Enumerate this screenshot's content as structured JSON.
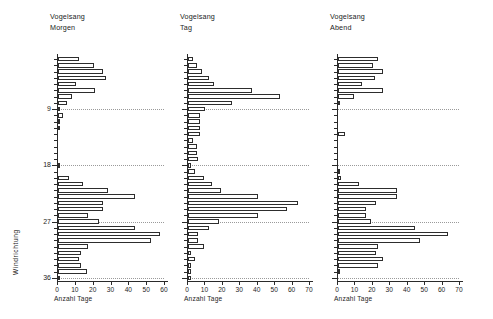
{
  "figure": {
    "axis_x_caption": "Anzahl Tage",
    "axis_y_caption": "Windrichtung",
    "y_tick_labels": [
      "9",
      "18",
      "27",
      "36"
    ],
    "y_tick_values": [
      9,
      18,
      27,
      36
    ],
    "gridline_values": [
      9,
      18,
      27,
      36
    ],
    "line_color": "#2d2d2d",
    "bar_fill": "#ffffff",
    "grid_color": "#9a9a9a"
  },
  "chart_data": [
    {
      "type": "bar",
      "orientation": "horizontal",
      "title": "Vogelsang",
      "subtitle": "Morgen",
      "xlabel": "Anzahl Tage",
      "ylabel": "Windrichtung",
      "xlim": [
        0,
        60
      ],
      "ylim": [
        0,
        37
      ],
      "xticks": [
        0,
        10,
        20,
        30,
        40,
        50,
        60
      ],
      "xtick_labels": [
        "0",
        "10",
        "20",
        "30",
        "40",
        "50",
        "60"
      ],
      "yticks": [
        9,
        18,
        27,
        36
      ],
      "grid": true,
      "categories": [
        1,
        2,
        3,
        4,
        5,
        6,
        7,
        8,
        9,
        10,
        11,
        12,
        13,
        14,
        15,
        16,
        17,
        18,
        19,
        20,
        21,
        22,
        23,
        24,
        25,
        26,
        27,
        28,
        29,
        30,
        31,
        32,
        33,
        34,
        35,
        36
      ],
      "values": [
        12,
        20,
        25,
        27,
        10,
        21,
        8,
        5,
        1,
        3,
        1,
        1,
        0,
        0,
        0,
        0,
        0,
        1,
        0,
        6,
        14,
        28,
        43,
        25,
        25,
        17,
        23,
        43,
        57,
        52,
        17,
        13,
        12,
        13,
        16,
        1
      ]
    },
    {
      "type": "bar",
      "orientation": "horizontal",
      "title": "Vogelsang",
      "subtitle": "Tag",
      "xlabel": "Anzahl Tage",
      "ylabel": "Windrichtung",
      "xlim": [
        0,
        70
      ],
      "ylim": [
        0,
        37
      ],
      "xticks": [
        0,
        10,
        20,
        30,
        40,
        50,
        60,
        70
      ],
      "xtick_labels": [
        "0",
        "10",
        "20",
        "30",
        "40",
        "50",
        "60",
        "70"
      ],
      "yticks": [
        9,
        18,
        27,
        36
      ],
      "grid": true,
      "categories": [
        1,
        2,
        3,
        4,
        5,
        6,
        7,
        8,
        9,
        10,
        11,
        12,
        13,
        14,
        15,
        16,
        17,
        18,
        19,
        20,
        21,
        22,
        23,
        24,
        25,
        26,
        27,
        28,
        29,
        30,
        31,
        32,
        33,
        34,
        35,
        36
      ],
      "values": [
        3,
        5,
        8,
        12,
        15,
        37,
        53,
        25,
        10,
        7,
        7,
        7,
        7,
        3,
        5,
        5,
        6,
        2,
        4,
        9,
        14,
        19,
        40,
        63,
        57,
        40,
        18,
        12,
        6,
        6,
        9,
        2,
        4,
        2,
        2,
        2
      ]
    },
    {
      "type": "bar",
      "orientation": "horizontal",
      "title": "Vogelsang",
      "subtitle": "Abend",
      "xlabel": "Anzahl Tage",
      "ylabel": "Windrichtung",
      "xlim": [
        0,
        70
      ],
      "ylim": [
        0,
        37
      ],
      "xticks": [
        0,
        10,
        20,
        30,
        40,
        50,
        60,
        70
      ],
      "xtick_labels": [
        "0",
        "10",
        "20",
        "30",
        "40",
        "50",
        "60",
        "70"
      ],
      "yticks": [
        9,
        18,
        27,
        36
      ],
      "grid": true,
      "categories": [
        1,
        2,
        3,
        4,
        5,
        6,
        7,
        8,
        9,
        10,
        11,
        12,
        13,
        14,
        15,
        16,
        17,
        18,
        19,
        20,
        21,
        22,
        23,
        24,
        25,
        26,
        27,
        28,
        29,
        30,
        31,
        32,
        33,
        34,
        35,
        36
      ],
      "values": [
        23,
        20,
        26,
        21,
        14,
        26,
        9,
        1,
        0,
        0,
        0,
        0,
        4,
        0,
        0,
        0,
        0,
        0,
        1,
        2,
        12,
        34,
        34,
        22,
        16,
        16,
        19,
        44,
        63,
        47,
        23,
        22,
        26,
        23,
        1,
        0
      ]
    }
  ]
}
